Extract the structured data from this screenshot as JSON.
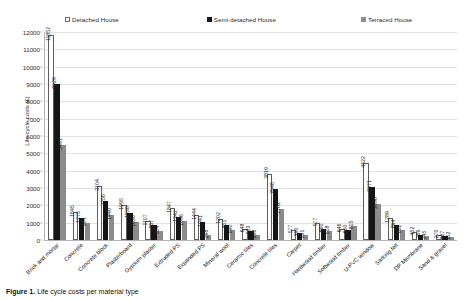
{
  "legend": {
    "items": [
      {
        "label": "Detached House",
        "icon": "square-outline-icon",
        "color": "#ffffff"
      },
      {
        "label": "Semi-detached House",
        "icon": "square-filled-icon",
        "color": "#151515"
      },
      {
        "label": "Terraced House",
        "icon": "square-grey-icon",
        "color": "#8b8b8b"
      }
    ]
  },
  "caption": {
    "prefix": "Figure 1.",
    "text": "Life cycle costs per material type"
  },
  "chart_data": {
    "type": "bar",
    "title": "",
    "xlabel": "",
    "ylabel": "Life cycle costs (£)",
    "ylim": [
      0,
      12000
    ],
    "yticks": [
      0,
      1000,
      2000,
      3000,
      4000,
      5000,
      6000,
      7000,
      8000,
      9000,
      10000,
      11000,
      12000
    ],
    "ytick_labels": [
      "0",
      "1000",
      "2000",
      "3000",
      "4000",
      "5000",
      "6000",
      "7000",
      "8000",
      "9000",
      "10000",
      "11000",
      "12000"
    ],
    "grid": true,
    "legend_position": "top",
    "categories": [
      "Brick and mortar",
      "Concrete",
      "Concrete block",
      "Plasterboard",
      "Gypsum plaster",
      "Extruded PS",
      "Expanded PS",
      "Mineral wool",
      "Ceramic tiles",
      "Concrete tiles",
      "Carpet",
      "Hardwood timber",
      "Softwood timber",
      "U-PVC window",
      "Sarking felt",
      "DP Membrane",
      "Sand & gravel"
    ],
    "series": [
      {
        "name": "Detached House",
        "color": "#ffffff",
        "values": [
          11852,
          1645,
          3104,
          1995,
          1107,
          1847,
          1444,
          1202,
          648,
          3819,
          577,
          977,
          646,
          4422,
          1289,
          452,
          270
        ]
      },
      {
        "name": "Semi-detached House",
        "color": "#151515",
        "values": [
          9029,
          1275,
          2256,
          1538,
          857,
          1342,
          1041,
          851,
          523,
          2946,
          390,
          660,
          600,
          3071,
          894,
          269,
          227
        ]
      },
      {
        "name": "Terraced House",
        "color": "#8b8b8b",
        "values": [
          5491,
          964,
          1440,
          1030,
          504,
          1096,
          298,
          590,
          288,
          1782,
          281,
          518,
          815,
          2098,
          602,
          245,
          152
        ]
      }
    ]
  }
}
